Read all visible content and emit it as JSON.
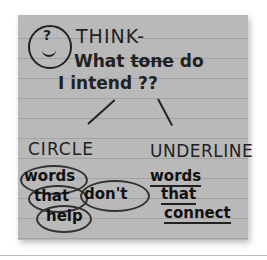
{
  "note": {
    "header": {
      "icon": "thinking-face-icon",
      "line1": "THINK-",
      "line2_prefix": "What ",
      "line2_struck": "tone",
      "line2_suffix": " do",
      "line3": "I intend ??"
    },
    "left_branch": {
      "heading": "CIRCLE",
      "words": [
        "words",
        "that",
        "don't",
        "help"
      ]
    },
    "right_branch": {
      "heading": "UNDERLINE",
      "words": [
        "words",
        "that",
        "connect"
      ]
    }
  },
  "colors": {
    "paper": "#b9b9b9",
    "ink": "#222222",
    "background": "#ffffff"
  }
}
